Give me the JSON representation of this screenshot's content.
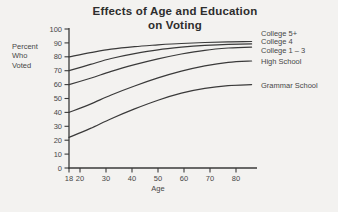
{
  "page": {
    "background": "#f3f2f0"
  },
  "title": {
    "line1": "Effects of Age and Education",
    "line2": "on Voting"
  },
  "chart_data": {
    "type": "line",
    "title": "Effects of Age and Education on Voting",
    "xlabel": "Age",
    "ylabel_lines": [
      "Percent",
      "Who",
      "Voted"
    ],
    "x": [
      18,
      24,
      32,
      41,
      50,
      59,
      68,
      77,
      86
    ],
    "x_ticks": [
      18,
      20,
      30,
      40,
      50,
      60,
      70,
      80
    ],
    "y_ticks": [
      0,
      10,
      20,
      30,
      40,
      50,
      60,
      70,
      80,
      90,
      100
    ],
    "xlim": [
      18,
      88
    ],
    "ylim": [
      0,
      100
    ],
    "grid": false,
    "legend_position": "right-of-lines",
    "series": [
      {
        "name": "College 5+",
        "values": [
          80,
          83,
          85.5,
          87.3,
          88.6,
          89.6,
          90.3,
          90.8,
          91
        ]
      },
      {
        "name": "College 4",
        "values": [
          70,
          74.5,
          78.8,
          82.3,
          85,
          86.9,
          88.2,
          89,
          89.3
        ]
      },
      {
        "name": "College 1 – 3",
        "values": [
          60,
          64.5,
          69.5,
          74.3,
          78.5,
          82,
          84.7,
          86.3,
          87
        ]
      },
      {
        "name": "High School",
        "values": [
          40,
          46,
          52.5,
          59,
          64.8,
          69.7,
          73.5,
          76,
          77
        ]
      },
      {
        "name": "Grammar School",
        "values": [
          22,
          28.5,
          35.5,
          42.5,
          48.8,
          53.8,
          57.3,
          59.3,
          60
        ]
      }
    ],
    "colors": {
      "line": "#3a3a3a",
      "text": "#474747",
      "title": "#2d2d2d",
      "background": "#f3f2f0"
    },
    "layout": {
      "label_x": 261,
      "label_y": [
        33.5,
        41.5,
        50,
        61.5,
        85
      ]
    }
  }
}
